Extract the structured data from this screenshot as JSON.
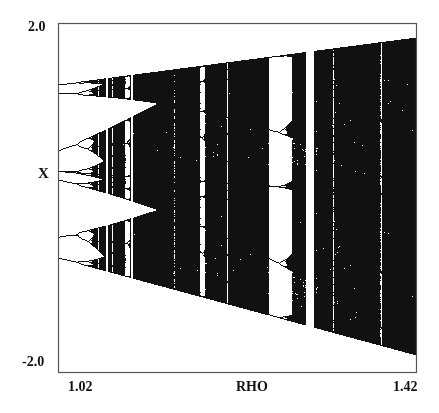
{
  "chart_data": {
    "type": "scatter",
    "title": "",
    "subtitle": "",
    "xlabel": "RHO",
    "ylabel": "X",
    "xlim": [
      1.02,
      1.42
    ],
    "ylim": [
      -2.0,
      2.0
    ],
    "x_tick_labels": [
      "1.02",
      "1.42"
    ],
    "y_tick_labels": [
      "2.0",
      "-2.0"
    ],
    "grid": false,
    "legend": null,
    "features": [
      {
        "name": "initial periodic branches",
        "rho_range": [
          1.02,
          1.045
        ],
        "x_values_approx": [
          1.37,
          1.0,
          -0.33,
          -0.95
        ]
      },
      {
        "name": "chaotic bands with gaps",
        "rho_range": [
          1.045,
          1.12
        ]
      },
      {
        "name": "band merging",
        "rho": 1.12
      },
      {
        "name": "large periodic window",
        "rho_range": [
          1.27,
          1.31
        ]
      },
      {
        "name": "narrow periodic window",
        "rho_range": [
          1.335,
          1.345
        ]
      },
      {
        "name": "upper envelope",
        "x_at_rho_start": 1.38,
        "x_at_rho_end": 1.82
      },
      {
        "name": "lower envelope",
        "x_at_rho_start": -0.95,
        "x_at_rho_end": -1.8
      }
    ]
  },
  "colors": {
    "ink": "#111111",
    "background": "#ffffff",
    "frame": "#555555"
  }
}
